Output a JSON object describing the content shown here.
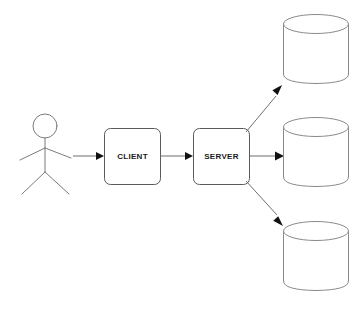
{
  "diagram": {
    "background_color": "#ffffff",
    "line_color": "#6f6f6f",
    "shape_stroke_color": "#8a8a8a",
    "arrow_color": "#111111",
    "label_color": "#1a1a1a",
    "actor": {
      "name": "user-actor",
      "icon": "stick-figure-icon",
      "label": ""
    },
    "nodes": [
      {
        "id": "client",
        "label": "CLIENT",
        "shape": "rounded-rectangle"
      },
      {
        "id": "server",
        "label": "SERVER",
        "shape": "rounded-rectangle"
      }
    ],
    "datastores": [
      {
        "id": "database-1",
        "label": "",
        "shape": "cylinder"
      },
      {
        "id": "database-2",
        "label": "",
        "shape": "cylinder"
      },
      {
        "id": "database-3",
        "label": "",
        "shape": "cylinder"
      }
    ],
    "connections": [
      {
        "from": "user-actor",
        "to": "client",
        "label": "",
        "style": "solid-arrow"
      },
      {
        "from": "client",
        "to": "server",
        "label": "",
        "style": "solid-arrow"
      },
      {
        "from": "server",
        "to": "database-1",
        "label": "",
        "style": "solid-arrow"
      },
      {
        "from": "server",
        "to": "database-2",
        "label": "",
        "style": "solid-arrow"
      },
      {
        "from": "server",
        "to": "database-3",
        "label": "",
        "style": "solid-arrow"
      }
    ]
  }
}
